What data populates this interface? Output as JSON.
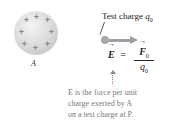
{
  "diagram": {
    "charged_body": {
      "label": "A",
      "charge_sign": "+",
      "charge_count": 9
    },
    "test_charge": {
      "label_prefix": "Test charge ",
      "symbol": "q",
      "subscript": "0"
    },
    "equation": {
      "lhs": "E",
      "equals": "=",
      "numerator": "F",
      "numerator_sub": "0",
      "denominator": "q",
      "denominator_sub": "0"
    },
    "caption": {
      "line1": "E is the force per unit",
      "line2": "charge exerted by A",
      "line3": "on a test charge at P."
    },
    "colors": {
      "sphere": "#d0d0d0",
      "plus": "#888888",
      "arrow": "#9aa0a6",
      "caption": "#7a7a7a"
    }
  }
}
